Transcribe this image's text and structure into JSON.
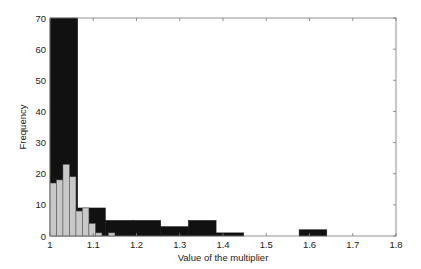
{
  "chart_data": {
    "type": "bar",
    "subtype": "overlaid-histogram",
    "title": "",
    "xlabel": "Value of the multiplier",
    "ylabel": "Frequency",
    "xlim": [
      1,
      1.8
    ],
    "ylim": [
      0,
      70
    ],
    "xticks": [
      "1",
      "1.1",
      "1.2",
      "1.3",
      "1.4",
      "1.5",
      "1.6",
      "1.7",
      "1.8"
    ],
    "yticks": [
      "0",
      "10",
      "20",
      "30",
      "40",
      "50",
      "60",
      "70"
    ],
    "grid": false,
    "legend": null,
    "series": [
      {
        "name": "dark histogram",
        "color": "#111111",
        "bin_width": 0.064,
        "bins": [
          {
            "x0": 1.0,
            "x1": 1.064,
            "value": 70
          },
          {
            "x0": 1.064,
            "x1": 1.128,
            "value": 9
          },
          {
            "x0": 1.128,
            "x1": 1.192,
            "value": 5
          },
          {
            "x0": 1.192,
            "x1": 1.256,
            "value": 5
          },
          {
            "x0": 1.256,
            "x1": 1.32,
            "value": 3
          },
          {
            "x0": 1.32,
            "x1": 1.384,
            "value": 5
          },
          {
            "x0": 1.384,
            "x1": 1.448,
            "value": 1
          },
          {
            "x0": 1.448,
            "x1": 1.512,
            "value": 0
          },
          {
            "x0": 1.512,
            "x1": 1.576,
            "value": 0
          },
          {
            "x0": 1.576,
            "x1": 1.64,
            "value": 2
          }
        ]
      },
      {
        "name": "light histogram",
        "color": "#c8c8c8",
        "bin_width": 0.015,
        "bins": [
          {
            "x0": 1.0,
            "x1": 1.015,
            "value": 17
          },
          {
            "x0": 1.015,
            "x1": 1.03,
            "value": 18
          },
          {
            "x0": 1.03,
            "x1": 1.045,
            "value": 23
          },
          {
            "x0": 1.045,
            "x1": 1.06,
            "value": 19
          },
          {
            "x0": 1.06,
            "x1": 1.075,
            "value": 8
          },
          {
            "x0": 1.075,
            "x1": 1.09,
            "value": 9
          },
          {
            "x0": 1.09,
            "x1": 1.105,
            "value": 4
          },
          {
            "x0": 1.105,
            "x1": 1.12,
            "value": 1
          },
          {
            "x0": 1.12,
            "x1": 1.135,
            "value": 0
          },
          {
            "x0": 1.135,
            "x1": 1.15,
            "value": 1
          }
        ]
      }
    ]
  }
}
